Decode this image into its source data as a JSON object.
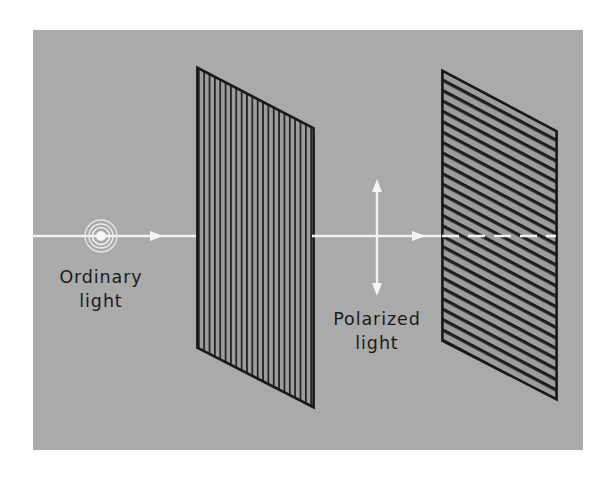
{
  "figure": {
    "canvas": {
      "width": 613,
      "height": 479
    },
    "background_color": "#ffffff",
    "plate_color": "#a8a8a8",
    "ink_color": "#1a1a1a",
    "ray_color": "#f2f2f2",
    "plate": {
      "x": 33,
      "y": 30,
      "width": 550,
      "height": 420
    }
  },
  "labels": {
    "ordinary_light": {
      "line1": "Ordinary",
      "line2": "light",
      "x": 101,
      "y1": 278,
      "y2": 302
    },
    "polarized_light": {
      "line1": "Polarized",
      "line2": "light",
      "x": 377,
      "y1": 320,
      "y2": 344
    }
  },
  "light_source": {
    "name": "Ordinary light source",
    "cx": 101,
    "cy": 236,
    "rings": [
      4,
      8,
      12,
      16
    ]
  },
  "ray": {
    "y": 236,
    "start_x": 33,
    "end_x": 583,
    "arrowheads_x": [
      158,
      425
    ],
    "dash_start_x": 442,
    "color": "#f2f2f2"
  },
  "polarization_arrow": {
    "name": "Vertical polarization double arrow",
    "x": 377,
    "top_y": 180,
    "bottom_y": 295,
    "color": "#f2f2f2"
  },
  "filters": [
    {
      "name": "first-polarizer",
      "orientation": "vertical",
      "grating": "vertical lines",
      "line_count": 22,
      "corners": {
        "top_left": [
          197,
          67
        ],
        "top_right": [
          314,
          128
        ],
        "bottom_right": [
          314,
          408
        ],
        "bottom_left": [
          197,
          348
        ]
      }
    },
    {
      "name": "second-polarizer",
      "orientation": "horizontal",
      "grating": "horizontal lines",
      "line_count": 30,
      "corners": {
        "top_left": [
          442,
          70
        ],
        "top_right": [
          557,
          131
        ],
        "bottom_right": [
          557,
          400
        ],
        "bottom_left": [
          442,
          341
        ]
      }
    }
  ]
}
